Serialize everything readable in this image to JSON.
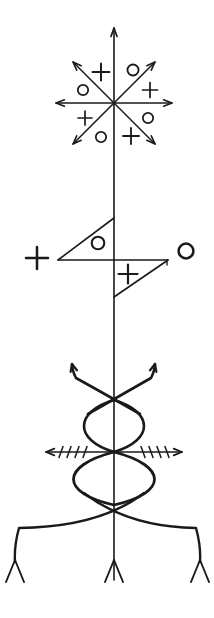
{
  "figure": {
    "ink_color": "#1a1a1a",
    "background_color": "#ffffff",
    "canvas": {
      "width": 214,
      "height": 618
    }
  },
  "pole": {
    "name": "central-stave",
    "x": 114,
    "top_y": 28,
    "bottom_y": 580,
    "stroke_width": 1.6
  },
  "star": {
    "name": "eight-ray-star",
    "center": {
      "x": 114,
      "y": 103
    },
    "ray_count": 8,
    "arrow_heads": 7,
    "radius": 58,
    "rays": [
      {
        "angle_deg": 90,
        "label": "up",
        "arrow": true
      },
      {
        "angle_deg": 45,
        "label": "up-right",
        "arrow": true
      },
      {
        "angle_deg": 0,
        "label": "right",
        "arrow": true
      },
      {
        "angle_deg": -45,
        "label": "down-right",
        "arrow": true
      },
      {
        "angle_deg": -90,
        "label": "down",
        "arrow": false
      },
      {
        "angle_deg": -135,
        "label": "down-left",
        "arrow": true
      },
      {
        "angle_deg": 180,
        "label": "left",
        "arrow": true
      },
      {
        "angle_deg": 135,
        "label": "up-left",
        "arrow": true
      }
    ],
    "symbols": [
      {
        "glyph": "+",
        "x": 101,
        "y": 72,
        "size": 17
      },
      {
        "glyph": "o",
        "x": 133,
        "y": 70,
        "size": 15
      },
      {
        "glyph": "o",
        "x": 83,
        "y": 90,
        "size": 14
      },
      {
        "glyph": "+",
        "x": 150,
        "y": 90,
        "size": 15
      },
      {
        "glyph": "+",
        "x": 85,
        "y": 118,
        "size": 14
      },
      {
        "glyph": "o",
        "x": 148,
        "y": 118,
        "size": 14
      },
      {
        "glyph": "o",
        "x": 101,
        "y": 137,
        "size": 14
      },
      {
        "glyph": "+",
        "x": 131,
        "y": 136,
        "size": 16
      }
    ]
  },
  "flag": {
    "name": "double-flag-band",
    "crossbar": {
      "x1": 58,
      "x2": 168,
      "y": 260
    },
    "upper_triangle": {
      "name": "upper-left-flag",
      "points": "114,218 114,260 58,260",
      "symbol": {
        "glyph": "o",
        "x": 98,
        "y": 243,
        "size": 17
      }
    },
    "lower_triangle": {
      "name": "lower-right-flag",
      "points": "114,260 168,260 114,297",
      "symbol": {
        "glyph": "+",
        "x": 128,
        "y": 274,
        "size": 19
      }
    },
    "side_symbols": [
      {
        "name": "left-plus",
        "glyph": "+",
        "x": 37,
        "y": 258,
        "size": 22
      },
      {
        "name": "right-circle",
        "glyph": "o",
        "x": 186,
        "y": 251,
        "size": 20
      }
    ]
  },
  "lower_section": {
    "name": "crossed-arrow-arms",
    "upper_cross": {
      "name": "upward-crossing-arrows",
      "crossing_point": {
        "x": 114,
        "y": 400
      },
      "left_tip": {
        "x": 72,
        "y": 364
      },
      "right_tip": {
        "x": 155,
        "y": 364
      }
    },
    "upper_lens": {
      "name": "upper-lens-loop",
      "top_y": 400,
      "bottom_y": 452,
      "half_width": 36
    },
    "barbed_arrow": {
      "name": "barbed-horizontal-arrow",
      "y": 452,
      "left_tip": 46,
      "right_tip": 182,
      "ticks_per_side": 4,
      "tick_height": 11
    },
    "lower_lens": {
      "name": "lower-lens-loop",
      "top_y": 452,
      "bottom_y": 505,
      "half_width": 48
    },
    "foot_arcs": {
      "name": "splayed-foot-arcs",
      "crossing_point": {
        "x": 114,
        "y": 505
      },
      "left_end": {
        "x": 15,
        "y": 562
      },
      "right_end": {
        "x": 200,
        "y": 562
      }
    }
  },
  "feet": {
    "name": "forked-feet",
    "count": 3,
    "items": [
      {
        "name": "foot-left",
        "x": 15,
        "top_y": 560,
        "bottom_y": 582,
        "spread": 9
      },
      {
        "name": "foot-center",
        "x": 114,
        "top_y": 560,
        "bottom_y": 582,
        "spread": 9
      },
      {
        "name": "foot-right",
        "x": 200,
        "top_y": 560,
        "bottom_y": 582,
        "spread": 9
      }
    ]
  }
}
